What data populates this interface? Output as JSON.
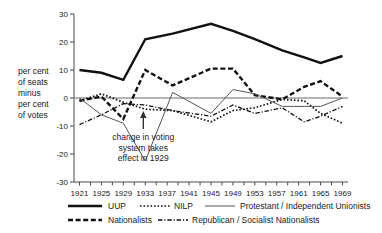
{
  "chart_data": {
    "type": "line",
    "title": "",
    "xlabel": "",
    "ylabel": "per cent of seats minus per cent of votes",
    "ylabel_lines": [
      "per cent",
      "of seats",
      "minus",
      "per cent",
      "of votes"
    ],
    "x": [
      1921,
      1925,
      1929,
      1933,
      1938,
      1945,
      1949,
      1953,
      1958,
      1962,
      1965,
      1969
    ],
    "xtick_labels": [
      "1921",
      "1925",
      "1929",
      "1933",
      "1937",
      "1941",
      "1945",
      "1949",
      "1953",
      "1957",
      "1961",
      "1965",
      "1969"
    ],
    "xtick_values": [
      1921,
      1925,
      1929,
      1933,
      1937,
      1941,
      1945,
      1949,
      1953,
      1957,
      1961,
      1965,
      1969
    ],
    "ytick_labels": [
      "30",
      "20",
      "10",
      "0",
      "-10",
      "-20",
      "-30"
    ],
    "ytick_values": [
      30,
      20,
      10,
      0,
      -10,
      -20,
      -30
    ],
    "ylim": [
      -30,
      30
    ],
    "xlim": [
      1920,
      1970
    ],
    "grid": false,
    "legend_position": "bottom",
    "annotations": [
      {
        "name": "voting-system-change",
        "lines": [
          "change in voting",
          "system takes",
          "effect in 1929"
        ],
        "arrow": "up",
        "x": 1929,
        "y": -20
      }
    ],
    "series": [
      {
        "name": "UUP",
        "style": "solid-thick",
        "color": "#111111",
        "x": [
          1921,
          1925,
          1929,
          1933,
          1938,
          1945,
          1949,
          1953,
          1958,
          1962,
          1965,
          1969
        ],
        "values": [
          10,
          9,
          6.5,
          21,
          23,
          26.5,
          24,
          21,
          17,
          14.5,
          12.5,
          15
        ]
      },
      {
        "name": "Nationalists",
        "style": "dashed-thick",
        "color": "#111111",
        "x": [
          1921,
          1925,
          1929,
          1933,
          1938,
          1945,
          1949,
          1953,
          1958,
          1962,
          1965,
          1969
        ],
        "values": [
          -1,
          0.5,
          -7.5,
          10,
          4.5,
          10.5,
          10.5,
          1,
          -0.5,
          4,
          6,
          0.5
        ]
      },
      {
        "name": "NILP",
        "style": "dotted",
        "color": "#111111",
        "x": [
          1921,
          1925,
          1929,
          1933,
          1938,
          1945,
          1949,
          1953,
          1958,
          1962,
          1965,
          1969
        ],
        "values": [
          -1,
          1.5,
          -1.5,
          -4,
          -4.5,
          -8.5,
          -4.5,
          -3.5,
          -0.5,
          -1,
          -5.5,
          -9
        ]
      },
      {
        "name": "Protestant / Independent Unionists",
        "style": "solid-thin",
        "color": "#555555",
        "x": [
          1921,
          1925,
          1929,
          1933,
          1938,
          1945,
          1949,
          1953,
          1958,
          1962,
          1965,
          1969
        ],
        "values": [
          0,
          -6,
          -9,
          -22.5,
          2,
          -5.5,
          3,
          1.5,
          -3,
          -3,
          -3,
          0
        ]
      },
      {
        "name": "Republican / Socialist Nationalists",
        "style": "dashdot",
        "color": "#111111",
        "x": [
          1921,
          1925,
          1929,
          1933,
          1938,
          1945,
          1949,
          1953,
          1958,
          1962,
          1965,
          1969
        ],
        "values": [
          -9.5,
          -6,
          -2,
          -2.5,
          -4.5,
          -6.5,
          -2.5,
          -5.5,
          -3.5,
          -8.5,
          -6.5,
          -3
        ]
      }
    ]
  },
  "legend": {
    "items": [
      {
        "label": "UUP",
        "style": "solid-thick"
      },
      {
        "label": "NILP",
        "style": "dotted"
      },
      {
        "label": "Protestant / Independent Unionists",
        "style": "solid-thin"
      },
      {
        "label": "Nationalists",
        "style": "dashed-thick"
      },
      {
        "label": "Republican / Socialist Nationalists",
        "style": "dashdot"
      }
    ]
  }
}
